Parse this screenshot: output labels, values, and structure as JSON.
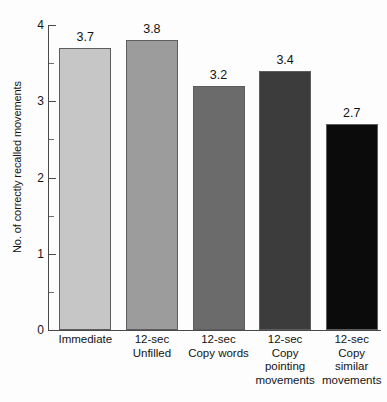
{
  "chart_data": {
    "type": "bar",
    "title": "",
    "xlabel": "",
    "ylabel": "No. of correctly recalled movements",
    "ylim": [
      0,
      4
    ],
    "grid": false,
    "legend": false,
    "y_major_ticks": [
      "0",
      "1",
      "2",
      "3",
      "4"
    ],
    "y_minor_ticks": [
      0.5,
      1.5,
      2.5,
      3.5
    ],
    "categories": [
      "Immediate",
      "12-sec Unfilled",
      "12-sec Copy words",
      "12-sec Copy pointing movements",
      "12-sec Copy similar movements"
    ],
    "category_lines": [
      [
        "Immediate"
      ],
      [
        "12-sec",
        "Unfilled"
      ],
      [
        "12-sec",
        "Copy words"
      ],
      [
        "12-sec",
        "Copy",
        "pointing",
        "movements"
      ],
      [
        "12-sec",
        "Copy",
        "similar",
        "movements"
      ]
    ],
    "values": [
      3.7,
      3.8,
      3.2,
      3.4,
      2.7
    ],
    "value_labels": [
      "3.7",
      "3.8",
      "3.2",
      "3.4",
      "2.7"
    ],
    "bar_colors": [
      "#c5c6c5",
      "#9b9c9b",
      "#6a6b6a",
      "#3b3c3b",
      "#0b0b0b"
    ],
    "bar_edge_color": "#5d5d5d",
    "axis_color": "#4a4a4a"
  }
}
